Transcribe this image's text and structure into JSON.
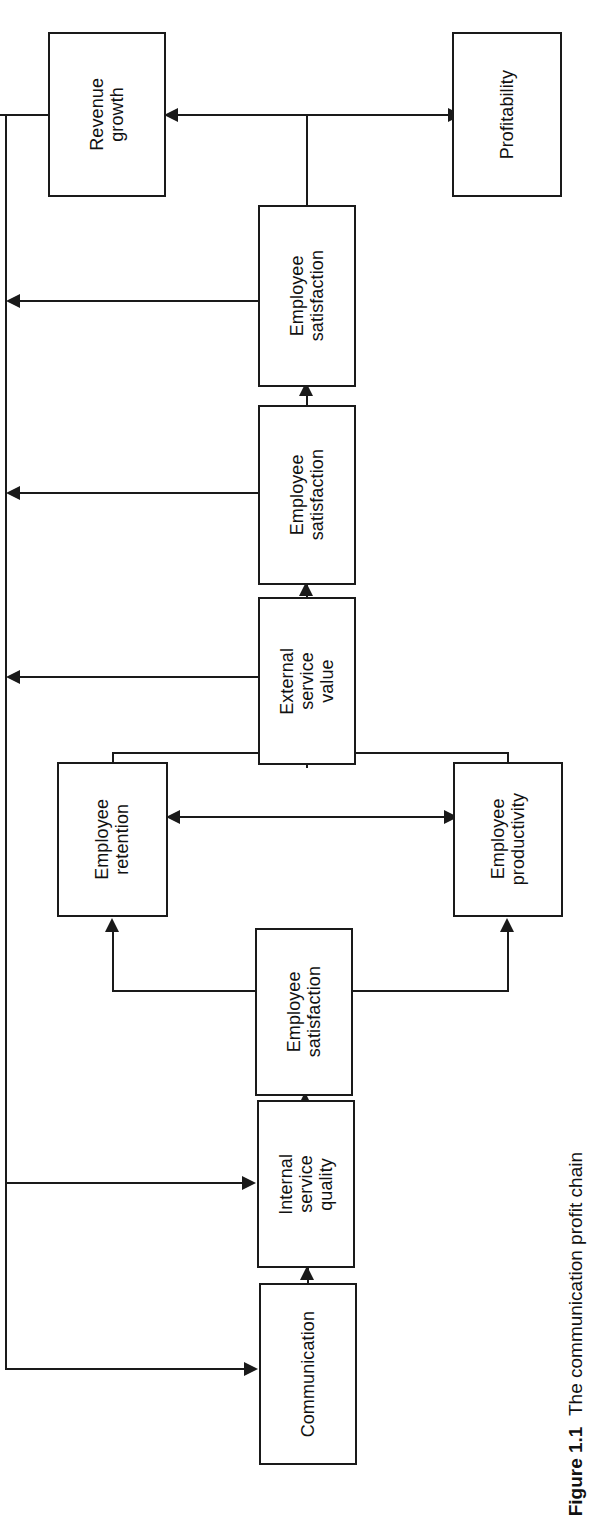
{
  "figure": {
    "caption_label": "Figure 1.1",
    "caption_text": "The communication profit chain"
  },
  "diagram": {
    "orientation": "rotated-90-ccw",
    "line_color": "#1a1a1a",
    "background": "#ffffff",
    "nodes": [
      {
        "id": "revenue_growth",
        "label": "Revenue\ngrowth"
      },
      {
        "id": "profitability",
        "label": "Profitability"
      },
      {
        "id": "employee_sat_top",
        "label": "Employee\nsatisfaction"
      },
      {
        "id": "employee_sat_mid",
        "label": "Employee\nsatisfaction"
      },
      {
        "id": "external_service_value",
        "label": "External\nservice\nvalue"
      },
      {
        "id": "employee_retention",
        "label": "Employee\nretention"
      },
      {
        "id": "employee_productivity",
        "label": "Employee\nproductivity"
      },
      {
        "id": "employee_sat_low",
        "label": "Employee\nsatisfaction"
      },
      {
        "id": "internal_service_quality",
        "label": "Internal\nservice\nquality"
      },
      {
        "id": "communication",
        "label": "Communication"
      }
    ],
    "edges": [
      {
        "from": "communication",
        "to": "internal_service_quality",
        "type": "arrow"
      },
      {
        "from": "internal_service_quality",
        "to": "employee_sat_low",
        "type": "arrow"
      },
      {
        "from": "employee_sat_low",
        "to": "employee_retention",
        "type": "arrow"
      },
      {
        "from": "employee_sat_low",
        "to": "employee_productivity",
        "type": "arrow"
      },
      {
        "from": "employee_retention",
        "to": "employee_productivity",
        "type": "bidirectional"
      },
      {
        "from": "employee_retention",
        "to": "external_service_value",
        "type": "line"
      },
      {
        "from": "employee_productivity",
        "to": "external_service_value",
        "type": "line"
      },
      {
        "from": "external_service_value",
        "to": "employee_sat_mid",
        "type": "arrow"
      },
      {
        "from": "employee_sat_mid",
        "to": "employee_sat_top",
        "type": "arrow"
      },
      {
        "from": "employee_sat_top",
        "to": "revenue_growth",
        "type": "arrow"
      },
      {
        "from": "revenue_growth",
        "to": "profitability",
        "type": "bidirectional"
      },
      {
        "from": "external_service_value",
        "to": "communication",
        "type": "feedback-arrow"
      },
      {
        "from": "employee_sat_mid",
        "to": "communication",
        "type": "feedback-arrow"
      },
      {
        "from": "employee_sat_top",
        "to": "communication",
        "type": "feedback-arrow"
      },
      {
        "from": "revenue_growth",
        "to": "internal_service_quality",
        "type": "feedback-arrow"
      }
    ]
  }
}
